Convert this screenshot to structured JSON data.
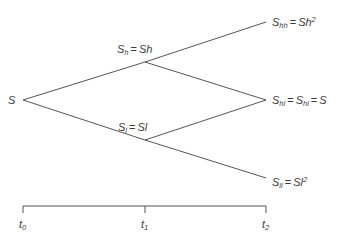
{
  "diagram": {
    "type": "binomial-tree",
    "line_color": "#555555",
    "text_color": "#3a3a3a",
    "nodes": {
      "root": {
        "base": "S",
        "sub": "",
        "rhs": ""
      },
      "up": {
        "base": "S",
        "sub": "h",
        "eq": "=",
        "rhs": "Sh"
      },
      "down": {
        "base": "S",
        "sub": "l",
        "eq": "=",
        "rhs": "Sl"
      },
      "upup": {
        "base": "S",
        "sub": "hh",
        "eq": "=",
        "rhs": "Sh",
        "rhs_sup": "2"
      },
      "updown": {
        "base": "S",
        "sub": "hl",
        "eq1": "=",
        "base2": "S",
        "sub2": "hl",
        "eq2": "=",
        "rhs": "S"
      },
      "downdown": {
        "base": "S",
        "sub": "ll",
        "eq": "=",
        "rhs": "Sl",
        "rhs_sup": "2"
      }
    },
    "edges": [
      [
        "root",
        "up"
      ],
      [
        "root",
        "down"
      ],
      [
        "up",
        "upup"
      ],
      [
        "up",
        "updown"
      ],
      [
        "down",
        "updown"
      ],
      [
        "down",
        "downdown"
      ]
    ],
    "timeline": {
      "ticks": [
        {
          "base": "t",
          "sub": "0"
        },
        {
          "base": "t",
          "sub": "1"
        },
        {
          "base": "t",
          "sub": "2"
        }
      ]
    }
  }
}
